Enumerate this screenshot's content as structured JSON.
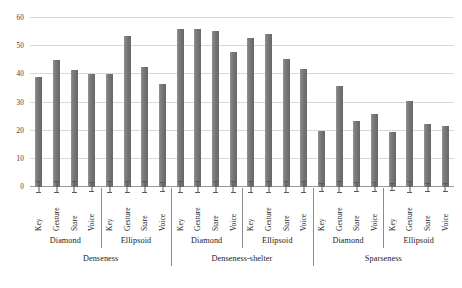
{
  "chart_data": {
    "type": "bar",
    "title": "",
    "xlabel": "",
    "ylabel": "",
    "ylim": [
      0,
      60
    ],
    "ytick_values": [
      0,
      10,
      20,
      30,
      40,
      50,
      60
    ],
    "ytick_labels": [
      "0",
      "10",
      "20",
      "30",
      "40",
      "50",
      "60"
    ],
    "grid": true,
    "legend": "none",
    "bar_color": "#767676",
    "errorbar_color": "#595959",
    "gridline_color": "#d8d8d8",
    "axis_color": "#9a9a9a",
    "categories": [
      "Key",
      "Gesture",
      "Stare",
      "Voice",
      "Key",
      "Gesture",
      "Stare",
      "Voice",
      "Key",
      "Gesture",
      "Stare",
      "Voice",
      "Key",
      "Gesture",
      "Stare",
      "Voice",
      "Key",
      "Gesture",
      "Stare",
      "Voice",
      "Key",
      "Gesture",
      "Stare",
      "Voice"
    ],
    "values": [
      39,
      45,
      41.5,
      40,
      40,
      53.5,
      42.5,
      36.5,
      56,
      56,
      55.5,
      48,
      53,
      54.5,
      45.5,
      42,
      20,
      36,
      23.5,
      26,
      19.5,
      30.5,
      22.5,
      21.5
    ],
    "errors": [
      2.0,
      2.2,
      2.0,
      1.8,
      2.0,
      2.3,
      2.2,
      1.9,
      2.3,
      2.3,
      2.2,
      2.1,
      2.2,
      2.3,
      2.1,
      2.0,
      1.6,
      2.1,
      1.8,
      1.9,
      1.5,
      2.0,
      1.6,
      1.6
    ],
    "group_level1": [
      {
        "label": "Diamond",
        "span": 4
      },
      {
        "label": "Ellipsoid",
        "span": 4
      },
      {
        "label": "Diamond",
        "span": 4
      },
      {
        "label": "Ellipsoid",
        "span": 4
      },
      {
        "label": "Diamond",
        "span": 4
      },
      {
        "label": "Ellipsoid",
        "span": 4
      }
    ],
    "group_level2": [
      {
        "label": "Denseness",
        "span": 8
      },
      {
        "label": "Denseness-shelter",
        "span": 8
      },
      {
        "label": "Sparseness",
        "span": 8
      }
    ]
  },
  "caption": {
    "text": ""
  }
}
